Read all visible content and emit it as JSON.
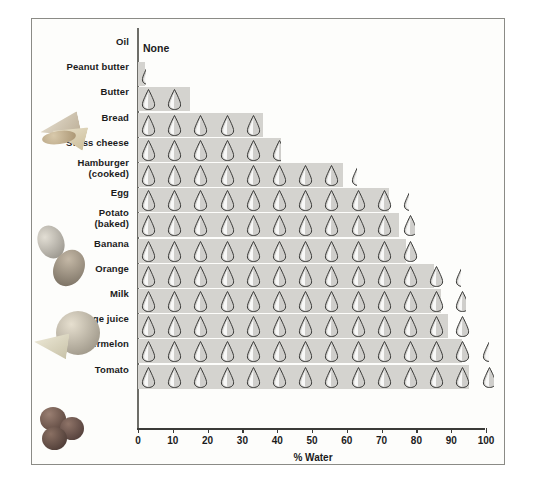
{
  "figure": {
    "axis_label": "% Water",
    "none_label": "None",
    "frame_color": "#8b8b86",
    "bar_color": "#d4d3cf",
    "drop_outline_color": "#3a3a38",
    "background": "#fdfdfb"
  },
  "xaxis": {
    "ticks": [
      0,
      10,
      20,
      30,
      40,
      50,
      60,
      70,
      80,
      90,
      100
    ],
    "tick_labels": [
      "0",
      "10",
      "20",
      "30",
      "40",
      "50",
      "60",
      "70",
      "80",
      "90",
      "100"
    ],
    "min": 0,
    "max": 100
  },
  "photos": [
    {
      "name": "bread-and-cheese-photo",
      "alt": "Bread and swiss cheese"
    },
    {
      "name": "egg-and-potato-photo",
      "alt": "Egg and baked potato"
    },
    {
      "name": "orange-and-slice-photo",
      "alt": "Orange and orange slice"
    },
    {
      "name": "tomatoes-photo",
      "alt": "Tomatoes"
    }
  ],
  "chart_data": {
    "type": "bar",
    "title": "",
    "xlabel": "% Water",
    "ylabel": "",
    "xlim": [
      0,
      100
    ],
    "grid": false,
    "legend": "none",
    "orientation": "horizontal",
    "note": "Each teardrop icon represents roughly 10% water; bar length encodes percent water content.",
    "categories": [
      "Oil",
      "Peanut butter",
      "Butter",
      "Bread",
      "Swiss cheese",
      "Hamburger (cooked)",
      "Egg",
      "Potato (baked)",
      "Banana",
      "Orange",
      "Milk",
      "Orange juice",
      "Watermelon",
      "Tomato"
    ],
    "values": [
      0,
      2,
      15,
      36,
      41,
      59,
      72,
      75,
      77,
      85,
      87,
      89,
      93,
      95
    ],
    "rows": [
      {
        "label": "Oil",
        "label_sub": "",
        "value": 0,
        "drops": 0,
        "text": "None"
      },
      {
        "label": "Peanut butter",
        "label_sub": "",
        "value": 2,
        "drops": 0,
        "partial": 0.3
      },
      {
        "label": "Butter",
        "label_sub": "",
        "value": 15,
        "drops": 1,
        "partial": 0.9
      },
      {
        "label": "Bread",
        "label_sub": "",
        "value": 36,
        "drops": 5,
        "partial": 0
      },
      {
        "label": "Swiss cheese",
        "label_sub": "",
        "value": 41,
        "drops": 5,
        "partial": 0.6
      },
      {
        "label": "Hamburger",
        "label_sub": "(cooked)",
        "value": 59,
        "drops": 8,
        "partial": 0.4
      },
      {
        "label": "Egg",
        "label_sub": "",
        "value": 72,
        "drops": 10,
        "partial": 0.4
      },
      {
        "label": "Potato",
        "label_sub": "(baked)",
        "value": 75,
        "drops": 10,
        "partial": 0.8
      },
      {
        "label": "Banana",
        "label_sub": "",
        "value": 77,
        "drops": 11,
        "partial": 0
      },
      {
        "label": "Orange",
        "label_sub": "",
        "value": 85,
        "drops": 12,
        "partial": 0.4
      },
      {
        "label": "Milk",
        "label_sub": "",
        "value": 87,
        "drops": 12,
        "partial": 0.7
      },
      {
        "label": "Orange juice",
        "label_sub": "",
        "value": 89,
        "drops": 13,
        "partial": 0
      },
      {
        "label": "Watermelon",
        "label_sub": "",
        "value": 93,
        "drops": 13,
        "partial": 0.5
      },
      {
        "label": "Tomato",
        "label_sub": "",
        "value": 95,
        "drops": 13,
        "partial": 0.8
      }
    ]
  }
}
